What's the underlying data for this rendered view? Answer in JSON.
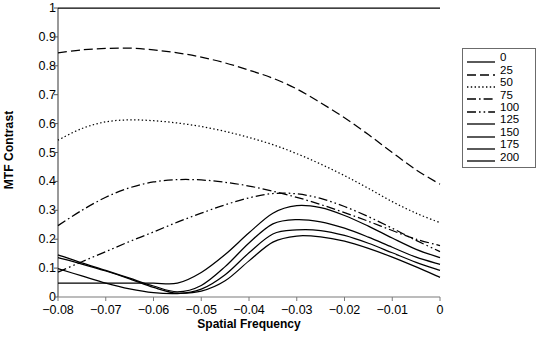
{
  "chart_data": {
    "type": "line",
    "title": "",
    "xlabel": "Spatial Frequency",
    "ylabel": "MTF Contrast",
    "xlim": [
      -0.08,
      0
    ],
    "ylim": [
      0,
      1
    ],
    "xticks": [
      "-0.08",
      "-0.07",
      "-0.06",
      "-0.05",
      "-0.04",
      "-0.03",
      "-0.02",
      "-0.01",
      "0"
    ],
    "xtick_values": [
      -0.08,
      -0.07,
      -0.06,
      -0.05,
      -0.04,
      -0.03,
      -0.02,
      -0.01,
      0
    ],
    "yticks": [
      "0",
      "0.1",
      "0.2",
      "0.3",
      "0.4",
      "0.5",
      "0.6",
      "0.7",
      "0.8",
      "0.9",
      "1"
    ],
    "ytick_values": [
      0,
      0.1,
      0.2,
      0.3,
      0.4,
      0.5,
      0.6,
      0.7,
      0.8,
      0.9,
      1
    ],
    "grid": false,
    "legend_position": "right",
    "legend_title": "",
    "x": [
      -0.08,
      -0.075,
      -0.07,
      -0.065,
      -0.06,
      -0.055,
      -0.05,
      -0.045,
      -0.04,
      -0.035,
      -0.03,
      -0.025,
      -0.02,
      -0.015,
      -0.01,
      -0.005,
      0
    ],
    "series": [
      {
        "name": "0",
        "dash": "solid",
        "color": "#000000",
        "values": [
          1.0,
          1.0,
          1.0,
          1.0,
          1.0,
          1.0,
          1.0,
          1.0,
          1.0,
          1.0,
          1.0,
          1.0,
          1.0,
          1.0,
          1.0,
          1.0,
          1.0
        ]
      },
      {
        "name": "25",
        "dash": "dashed",
        "color": "#000000",
        "values": [
          0.845,
          0.855,
          0.86,
          0.861,
          0.855,
          0.845,
          0.83,
          0.81,
          0.785,
          0.757,
          0.72,
          0.672,
          0.62,
          0.562,
          0.5,
          0.44,
          0.39
        ]
      },
      {
        "name": "50",
        "dash": "dotted",
        "color": "#000000",
        "values": [
          0.543,
          0.583,
          0.606,
          0.613,
          0.61,
          0.602,
          0.59,
          0.573,
          0.552,
          0.527,
          0.496,
          0.46,
          0.42,
          0.376,
          0.33,
          0.29,
          0.257
        ]
      },
      {
        "name": "75",
        "dash": "dashdot",
        "color": "#000000",
        "values": [
          0.247,
          0.3,
          0.345,
          0.378,
          0.398,
          0.406,
          0.405,
          0.397,
          0.384,
          0.366,
          0.345,
          0.32,
          0.292,
          0.262,
          0.23,
          0.2,
          0.178
        ]
      },
      {
        "name": "100",
        "dash": "dashdotdot",
        "color": "#000000",
        "values": [
          0.086,
          0.122,
          0.157,
          0.192,
          0.225,
          0.259,
          0.29,
          0.319,
          0.343,
          0.358,
          0.357,
          0.341,
          0.313,
          0.278,
          0.238,
          0.196,
          0.157
        ]
      },
      {
        "name": "125",
        "dash": "solid",
        "color": "#000000",
        "values": [
          0.048,
          0.048,
          0.048,
          0.048,
          0.048,
          0.048,
          0.085,
          0.147,
          0.222,
          0.29,
          0.316,
          0.309,
          0.282,
          0.245,
          0.204,
          0.165,
          0.136
        ]
      },
      {
        "name": "150",
        "dash": "solid",
        "color": "#000000",
        "values": [
          0.146,
          0.118,
          0.092,
          0.065,
          0.038,
          0.018,
          0.04,
          0.105,
          0.187,
          0.253,
          0.268,
          0.26,
          0.238,
          0.207,
          0.172,
          0.138,
          0.113
        ]
      },
      {
        "name": "175",
        "dash": "solid",
        "color": "#000000",
        "values": [
          0.136,
          0.114,
          0.09,
          0.063,
          0.033,
          0.013,
          0.027,
          0.077,
          0.153,
          0.218,
          0.232,
          0.23,
          0.213,
          0.186,
          0.153,
          0.12,
          0.092
        ]
      },
      {
        "name": "200",
        "dash": "solid",
        "color": "#000000",
        "values": [
          0.098,
          0.073,
          0.048,
          0.028,
          0.015,
          0.012,
          0.02,
          0.056,
          0.125,
          0.19,
          0.211,
          0.208,
          0.193,
          0.168,
          0.138,
          0.104,
          0.068
        ]
      }
    ]
  },
  "caption": ""
}
